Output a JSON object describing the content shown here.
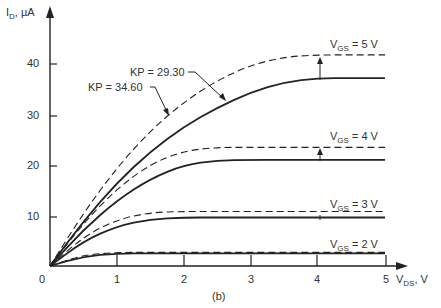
{
  "chart_data": {
    "type": "line",
    "title": "",
    "caption": "(b)",
    "xlabel": "V_DS, V",
    "ylabel": "I_D, µA",
    "xlim": [
      0,
      5
    ],
    "ylim": [
      0,
      45
    ],
    "x_ticks": [
      "1",
      "2",
      "3",
      "4",
      "5"
    ],
    "y_ticks": [
      "10",
      "20",
      "30",
      "40"
    ],
    "origin_label": "0",
    "grid": false,
    "annotations": [
      "KP = 29.30",
      "KP = 34.60",
      "VGS = 5 V",
      "VGS = 4 V",
      "VGS = 3 V",
      "VGS = 2 V"
    ],
    "x": [
      0,
      0.5,
      1,
      1.5,
      2,
      2.5,
      3,
      3.5,
      4,
      4.5,
      5
    ],
    "series": [
      {
        "name": "VGS = 5 V, KP = 34.60 (dashed)",
        "style": "dashed",
        "values": [
          0,
          10.5,
          19.5,
          26.8,
          32.5,
          36.8,
          39.8,
          41.4,
          41.8,
          41.8,
          41.8
        ]
      },
      {
        "name": "VGS = 5 V, KP = 29.30 (solid)",
        "style": "solid",
        "values": [
          0,
          8.9,
          16.5,
          22.7,
          27.6,
          31.4,
          34.4,
          36.4,
          37.2,
          37.2,
          37.2
        ]
      },
      {
        "name": "VGS = 4 V, KP = 34.60 (dashed)",
        "style": "dashed",
        "values": [
          0,
          8.5,
          15.3,
          20.2,
          22.8,
          23.5,
          23.5,
          23.5,
          23.5,
          23.5,
          23.5
        ]
      },
      {
        "name": "VGS = 4 V, KP = 29.30 (solid)",
        "style": "solid",
        "values": [
          0,
          7.2,
          13.0,
          17.3,
          20.0,
          20.9,
          21.0,
          21.0,
          21.0,
          21.0,
          21.0
        ]
      },
      {
        "name": "VGS = 3 V, KP = 34.60 (dashed)",
        "style": "dashed",
        "values": [
          0,
          5.8,
          9.2,
          10.6,
          10.8,
          10.8,
          10.8,
          10.8,
          10.8,
          10.8,
          10.8
        ]
      },
      {
        "name": "VGS = 3 V, KP = 29.30 (solid)",
        "style": "solid",
        "values": [
          0,
          4.9,
          7.9,
          9.3,
          9.6,
          9.6,
          9.6,
          9.6,
          9.6,
          9.6,
          9.6
        ]
      },
      {
        "name": "VGS = 2 V, KP = 34.60 (dashed)",
        "style": "dashed",
        "values": [
          0,
          2.2,
          2.7,
          2.7,
          2.7,
          2.7,
          2.7,
          2.7,
          2.7,
          2.7,
          2.7
        ]
      },
      {
        "name": "VGS = 2 V, KP = 29.30 (solid)",
        "style": "solid",
        "values": [
          0,
          1.9,
          2.5,
          2.5,
          2.5,
          2.5,
          2.5,
          2.5,
          2.5,
          2.5,
          2.5
        ]
      }
    ]
  },
  "labels": {
    "ylabel_main": "I",
    "ylabel_sub": "D",
    "ylabel_unit": ", µA",
    "xlabel_main": "V",
    "xlabel_sub": "DS",
    "xlabel_unit": ", V",
    "caption": "(b)",
    "origin": "0",
    "kp1": "KP = 29.30",
    "kp2": "KP = 34.60",
    "vgs5_main": "V",
    "vgs5_sub": "GS",
    "vgs5_val": " = 5 V",
    "vgs4_main": "V",
    "vgs4_sub": "GS",
    "vgs4_val": " = 4 V",
    "vgs3_main": "V",
    "vgs3_sub": "GS",
    "vgs3_val": " = 3 V",
    "vgs2_main": "V",
    "vgs2_sub": "GS",
    "vgs2_val": " = 2 V",
    "xt1": "1",
    "xt2": "2",
    "xt3": "3",
    "xt4": "4",
    "xt5": "5",
    "yt10": "10",
    "yt20": "20",
    "yt30": "30",
    "yt40": "40"
  }
}
